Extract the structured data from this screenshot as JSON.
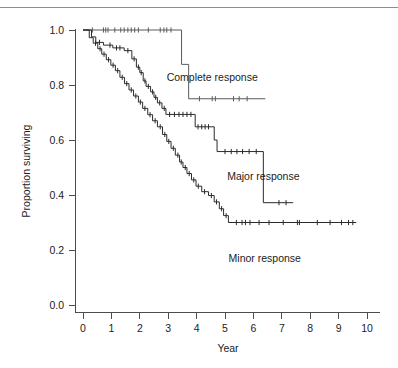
{
  "figure": {
    "background": "#ffffff",
    "rule_color": "#8d8d8d",
    "axis_color": "#4d4d4d"
  },
  "chart_data": {
    "type": "line",
    "subtype": "kaplan-meier-step",
    "title": "",
    "xlabel": "Year",
    "ylabel": "Proportion surviving",
    "xlim": [
      0,
      10
    ],
    "ylim": [
      0.0,
      1.0
    ],
    "grid": false,
    "legend_position": "inline-annotations",
    "xticks": [
      0,
      1,
      2,
      3,
      4,
      5,
      6,
      7,
      8,
      9,
      10
    ],
    "xtick_labels": [
      "0",
      "1",
      "2",
      "3",
      "4",
      "5",
      "6",
      "7",
      "8",
      "9",
      "10"
    ],
    "yticks": [
      0.0,
      0.2,
      0.4,
      0.6,
      0.8,
      1.0
    ],
    "ytick_labels": [
      "0.0",
      "0.2",
      "0.4",
      "0.6",
      "0.8",
      "1.0"
    ],
    "series": [
      {
        "name": "Complete response",
        "color": "#5a5a5a",
        "label_x": 4.55,
        "label_y": 0.815,
        "steps": [
          [
            0.0,
            1.0
          ],
          [
            3.47,
            1.0
          ],
          [
            3.47,
            0.875
          ],
          [
            3.72,
            0.875
          ],
          [
            3.72,
            0.75
          ],
          [
            6.42,
            0.75
          ]
        ],
        "censor_times": [
          0.33,
          0.72,
          0.8,
          0.88,
          1.12,
          1.33,
          1.45,
          1.58,
          1.7,
          1.82,
          1.95,
          2.3,
          2.72,
          2.85,
          2.95,
          3.1,
          4.1,
          4.55,
          4.66,
          5.3,
          5.5,
          5.78
        ],
        "censor_values": [
          1.0,
          1.0,
          1.0,
          1.0,
          1.0,
          1.0,
          1.0,
          1.0,
          1.0,
          1.0,
          1.0,
          1.0,
          1.0,
          1.0,
          1.0,
          1.0,
          0.75,
          0.75,
          0.75,
          0.75,
          0.75,
          0.75
        ]
      },
      {
        "name": "Major response",
        "color": "#2b2b2b",
        "label_x": 6.35,
        "label_y": 0.455,
        "steps": [
          [
            0.0,
            1.0
          ],
          [
            0.3,
            1.0
          ],
          [
            0.3,
            0.975
          ],
          [
            0.45,
            0.975
          ],
          [
            0.45,
            0.955
          ],
          [
            0.72,
            0.955
          ],
          [
            0.72,
            0.945
          ],
          [
            1.05,
            0.945
          ],
          [
            1.05,
            0.935
          ],
          [
            1.45,
            0.935
          ],
          [
            1.45,
            0.925
          ],
          [
            1.72,
            0.925
          ],
          [
            1.72,
            0.895
          ],
          [
            1.88,
            0.895
          ],
          [
            1.88,
            0.865
          ],
          [
            2.0,
            0.865
          ],
          [
            2.0,
            0.845
          ],
          [
            2.12,
            0.845
          ],
          [
            2.12,
            0.815
          ],
          [
            2.22,
            0.815
          ],
          [
            2.22,
            0.795
          ],
          [
            2.38,
            0.795
          ],
          [
            2.38,
            0.775
          ],
          [
            2.5,
            0.775
          ],
          [
            2.5,
            0.755
          ],
          [
            2.62,
            0.755
          ],
          [
            2.62,
            0.735
          ],
          [
            2.78,
            0.735
          ],
          [
            2.78,
            0.715
          ],
          [
            2.92,
            0.715
          ],
          [
            2.92,
            0.693
          ],
          [
            3.95,
            0.693
          ],
          [
            3.95,
            0.648
          ],
          [
            4.62,
            0.648
          ],
          [
            4.62,
            0.6
          ],
          [
            4.72,
            0.6
          ],
          [
            4.72,
            0.558
          ],
          [
            6.35,
            0.558
          ],
          [
            6.35,
            0.372
          ],
          [
            7.4,
            0.372
          ]
        ],
        "censor_times": [
          0.58,
          0.95,
          1.18,
          1.3,
          1.58,
          1.8,
          1.95,
          2.05,
          2.18,
          2.3,
          2.45,
          2.56,
          2.7,
          2.86,
          3.05,
          3.22,
          3.38,
          3.52,
          3.66,
          3.8,
          4.05,
          4.18,
          4.3,
          4.42,
          5.0,
          5.22,
          5.42,
          5.62,
          5.85,
          6.1,
          6.9,
          7.15
        ],
        "censor_values": [
          0.955,
          0.945,
          0.935,
          0.935,
          0.925,
          0.895,
          0.865,
          0.845,
          0.815,
          0.795,
          0.775,
          0.755,
          0.735,
          0.715,
          0.693,
          0.693,
          0.693,
          0.693,
          0.693,
          0.693,
          0.648,
          0.648,
          0.648,
          0.648,
          0.558,
          0.558,
          0.558,
          0.558,
          0.558,
          0.558,
          0.372,
          0.372
        ]
      },
      {
        "name": "Minor response",
        "color": "#2b2b2b",
        "label_x": 6.4,
        "label_y": 0.158,
        "steps": [
          [
            0.0,
            1.0
          ],
          [
            0.22,
            1.0
          ],
          [
            0.22,
            0.972
          ],
          [
            0.36,
            0.972
          ],
          [
            0.36,
            0.952
          ],
          [
            0.52,
            0.952
          ],
          [
            0.52,
            0.932
          ],
          [
            0.66,
            0.932
          ],
          [
            0.66,
            0.912
          ],
          [
            0.82,
            0.912
          ],
          [
            0.82,
            0.892
          ],
          [
            0.98,
            0.892
          ],
          [
            0.98,
            0.872
          ],
          [
            1.14,
            0.872
          ],
          [
            1.14,
            0.852
          ],
          [
            1.3,
            0.852
          ],
          [
            1.3,
            0.828
          ],
          [
            1.46,
            0.828
          ],
          [
            1.46,
            0.805
          ],
          [
            1.62,
            0.805
          ],
          [
            1.62,
            0.782
          ],
          [
            1.78,
            0.782
          ],
          [
            1.78,
            0.76
          ],
          [
            1.95,
            0.76
          ],
          [
            1.95,
            0.738
          ],
          [
            2.1,
            0.738
          ],
          [
            2.1,
            0.715
          ],
          [
            2.28,
            0.715
          ],
          [
            2.28,
            0.692
          ],
          [
            2.45,
            0.692
          ],
          [
            2.45,
            0.67
          ],
          [
            2.62,
            0.67
          ],
          [
            2.62,
            0.648
          ],
          [
            2.8,
            0.648
          ],
          [
            2.8,
            0.62
          ],
          [
            2.95,
            0.62
          ],
          [
            2.95,
            0.595
          ],
          [
            3.1,
            0.595
          ],
          [
            3.1,
            0.57
          ],
          [
            3.25,
            0.57
          ],
          [
            3.25,
            0.545
          ],
          [
            3.4,
            0.545
          ],
          [
            3.4,
            0.52
          ],
          [
            3.52,
            0.52
          ],
          [
            3.52,
            0.5
          ],
          [
            3.66,
            0.5
          ],
          [
            3.66,
            0.478
          ],
          [
            3.82,
            0.478
          ],
          [
            3.82,
            0.455
          ],
          [
            3.98,
            0.455
          ],
          [
            3.98,
            0.432
          ],
          [
            4.18,
            0.432
          ],
          [
            4.18,
            0.412
          ],
          [
            4.42,
            0.412
          ],
          [
            4.42,
            0.398
          ],
          [
            4.62,
            0.398
          ],
          [
            4.62,
            0.375
          ],
          [
            4.8,
            0.375
          ],
          [
            4.8,
            0.35
          ],
          [
            4.95,
            0.35
          ],
          [
            4.95,
            0.325
          ],
          [
            5.12,
            0.325
          ],
          [
            5.12,
            0.3
          ],
          [
            9.62,
            0.3
          ]
        ],
        "censor_times": [
          0.44,
          0.6,
          0.74,
          0.9,
          1.06,
          1.22,
          1.38,
          1.54,
          1.7,
          1.86,
          2.02,
          2.18,
          2.36,
          2.54,
          2.72,
          2.88,
          3.02,
          3.18,
          3.34,
          3.46,
          3.6,
          3.74,
          3.9,
          4.06,
          4.28,
          4.52,
          4.7,
          4.88,
          5.04,
          5.4,
          5.6,
          5.72,
          5.88,
          6.2,
          6.55,
          7.05,
          7.55,
          7.62,
          8.25,
          8.7,
          9.1,
          9.35,
          9.5
        ],
        "censor_values": [
          0.952,
          0.932,
          0.912,
          0.892,
          0.872,
          0.852,
          0.828,
          0.805,
          0.782,
          0.76,
          0.738,
          0.715,
          0.692,
          0.67,
          0.648,
          0.62,
          0.595,
          0.57,
          0.545,
          0.52,
          0.5,
          0.478,
          0.455,
          0.432,
          0.412,
          0.398,
          0.375,
          0.35,
          0.325,
          0.3,
          0.3,
          0.3,
          0.3,
          0.3,
          0.3,
          0.3,
          0.3,
          0.3,
          0.3,
          0.3,
          0.3,
          0.3,
          0.3
        ]
      }
    ]
  }
}
